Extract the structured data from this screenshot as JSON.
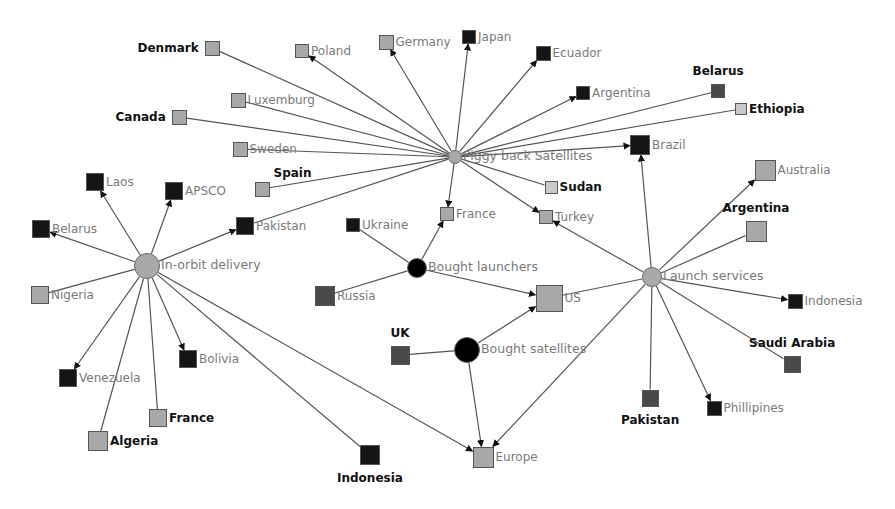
{
  "diagram": {
    "type": "network",
    "colors": {
      "light": "#a8a8a8",
      "medium": "#4a4a4a",
      "dark": "#151515",
      "pale": "#c9c9c9",
      "hub_gray": "#a9a9a9",
      "hub_black": "#000000",
      "edge": "#555555"
    },
    "hubs": [
      {
        "id": "piggy",
        "label": "Piggy back Satellites",
        "x": 455,
        "y": 157,
        "r": 7,
        "color": "hub_gray"
      },
      {
        "id": "inorbit",
        "label": "In-orbit delivery",
        "x": 147,
        "y": 266,
        "r": 13,
        "color": "hub_gray"
      },
      {
        "id": "launchers",
        "label": "Bought launchers",
        "x": 417,
        "y": 268,
        "r": 10,
        "color": "hub_black"
      },
      {
        "id": "satellites",
        "label": "Bought satellites",
        "x": 467,
        "y": 350,
        "r": 13,
        "color": "hub_black"
      },
      {
        "id": "launchsvc",
        "label": "Launch services",
        "x": 652,
        "y": 277,
        "r": 10,
        "color": "hub_gray"
      }
    ],
    "nodes": [
      {
        "id": "denmark",
        "label": "Denmark",
        "x": 212,
        "y": 48,
        "s": 15,
        "color": "light",
        "lpos": "left",
        "bold": true
      },
      {
        "id": "poland",
        "label": "Poland",
        "x": 302,
        "y": 51,
        "s": 14,
        "color": "light",
        "lpos": "right",
        "bold": false
      },
      {
        "id": "germany",
        "label": "Germany",
        "x": 386,
        "y": 42,
        "s": 15,
        "color": "light",
        "lpos": "right",
        "bold": false
      },
      {
        "id": "japan",
        "label": "Japan",
        "x": 469,
        "y": 37,
        "s": 14,
        "color": "dark",
        "lpos": "right",
        "bold": false
      },
      {
        "id": "ecuador",
        "label": "Ecuador",
        "x": 543,
        "y": 53,
        "s": 15,
        "color": "dark",
        "lpos": "right",
        "bold": false
      },
      {
        "id": "argentina1",
        "label": "Argentina",
        "x": 583,
        "y": 93,
        "s": 14,
        "color": "dark",
        "lpos": "right",
        "bold": false
      },
      {
        "id": "belarus1",
        "label": "Belarus",
        "x": 718,
        "y": 91,
        "s": 14,
        "color": "medium",
        "lpos": "top",
        "bold": true
      },
      {
        "id": "ethiopia",
        "label": "Ethiopia",
        "x": 741,
        "y": 109,
        "s": 12,
        "color": "pale",
        "lpos": "right",
        "bold": true
      },
      {
        "id": "luxemburg",
        "label": "Luxemburg",
        "x": 238,
        "y": 100,
        "s": 15,
        "color": "light",
        "lpos": "right",
        "bold": false
      },
      {
        "id": "canada",
        "label": "Canada",
        "x": 179,
        "y": 117,
        "s": 15,
        "color": "light",
        "lpos": "left",
        "bold": true
      },
      {
        "id": "sweden",
        "label": "Sweden",
        "x": 240,
        "y": 149,
        "s": 15,
        "color": "light",
        "lpos": "right",
        "bold": false
      },
      {
        "id": "spain",
        "label": "Spain",
        "x": 262,
        "y": 189,
        "s": 15,
        "color": "light",
        "lpos": "topright",
        "bold": true
      },
      {
        "id": "brazil",
        "label": "Brazil",
        "x": 640,
        "y": 145,
        "s": 20,
        "color": "dark",
        "lpos": "right",
        "bold": false
      },
      {
        "id": "sudan",
        "label": "Sudan",
        "x": 551,
        "y": 187,
        "s": 13,
        "color": "pale",
        "lpos": "right",
        "bold": true
      },
      {
        "id": "france1",
        "label": "France",
        "x": 447,
        "y": 214,
        "s": 14,
        "color": "light",
        "lpos": "right",
        "bold": false
      },
      {
        "id": "turkey",
        "label": "Turkey",
        "x": 546,
        "y": 217,
        "s": 14,
        "color": "light",
        "lpos": "right",
        "bold": false
      },
      {
        "id": "laos",
        "label": "Laos",
        "x": 95,
        "y": 182,
        "s": 18,
        "color": "dark",
        "lpos": "right",
        "bold": false
      },
      {
        "id": "apsco",
        "label": "APSCO",
        "x": 174,
        "y": 191,
        "s": 18,
        "color": "dark",
        "lpos": "right",
        "bold": false
      },
      {
        "id": "belarus2",
        "label": "Belarus",
        "x": 41,
        "y": 229,
        "s": 18,
        "color": "dark",
        "lpos": "right",
        "bold": false
      },
      {
        "id": "pakistan1",
        "label": "Pakistan",
        "x": 245,
        "y": 226,
        "s": 18,
        "color": "dark",
        "lpos": "right",
        "bold": false
      },
      {
        "id": "ukraine",
        "label": "Ukraine",
        "x": 353,
        "y": 225,
        "s": 14,
        "color": "dark",
        "lpos": "right",
        "bold": false
      },
      {
        "id": "nigeria",
        "label": "Nigeria",
        "x": 40,
        "y": 295,
        "s": 18,
        "color": "light",
        "lpos": "right",
        "bold": false
      },
      {
        "id": "russia",
        "label": "Russia",
        "x": 325,
        "y": 296,
        "s": 20,
        "color": "medium",
        "lpos": "right",
        "bold": false
      },
      {
        "id": "us",
        "label": "US",
        "x": 549,
        "y": 298,
        "s": 27,
        "color": "light",
        "lpos": "right",
        "bold": false
      },
      {
        "id": "uk",
        "label": "UK",
        "x": 400,
        "y": 355,
        "s": 19,
        "color": "medium",
        "lpos": "top",
        "bold": true
      },
      {
        "id": "australia",
        "label": "Australia",
        "x": 765,
        "y": 170,
        "s": 21,
        "color": "light",
        "lpos": "right",
        "bold": false
      },
      {
        "id": "argentina2",
        "label": "Argentina",
        "x": 756,
        "y": 231,
        "s": 21,
        "color": "light",
        "lpos": "top",
        "bold": true
      },
      {
        "id": "indonesia1",
        "label": "Indonesia",
        "x": 795,
        "y": 301,
        "s": 15,
        "color": "dark",
        "lpos": "right",
        "bold": false
      },
      {
        "id": "saudi",
        "label": "Saudi Arabia",
        "x": 792,
        "y": 364,
        "s": 17,
        "color": "medium",
        "lpos": "top",
        "bold": true
      },
      {
        "id": "bolivia",
        "label": "Bolivia",
        "x": 188,
        "y": 359,
        "s": 18,
        "color": "dark",
        "lpos": "right",
        "bold": false
      },
      {
        "id": "venezuela",
        "label": "Venezuela",
        "x": 68,
        "y": 378,
        "s": 18,
        "color": "dark",
        "lpos": "right",
        "bold": false
      },
      {
        "id": "france2",
        "label": "France",
        "x": 158,
        "y": 418,
        "s": 18,
        "color": "light",
        "lpos": "right",
        "bold": true
      },
      {
        "id": "algeria",
        "label": "Algeria",
        "x": 98,
        "y": 441,
        "s": 20,
        "color": "light",
        "lpos": "right",
        "bold": true
      },
      {
        "id": "indonesia2",
        "label": "Indonesia",
        "x": 370,
        "y": 455,
        "s": 20,
        "color": "dark",
        "lpos": "bottom",
        "bold": true
      },
      {
        "id": "europe",
        "label": "Europe",
        "x": 483,
        "y": 457,
        "s": 21,
        "color": "light",
        "lpos": "right",
        "bold": false
      },
      {
        "id": "pakistan2",
        "label": "Pakistan",
        "x": 650,
        "y": 398,
        "s": 17,
        "color": "medium",
        "lpos": "bottom",
        "bold": true
      },
      {
        "id": "phillipines",
        "label": "Phillipines",
        "x": 714,
        "y": 408,
        "s": 15,
        "color": "dark",
        "lpos": "right",
        "bold": false
      }
    ],
    "edges": [
      {
        "from": "piggy",
        "to": "denmark",
        "arrow": false
      },
      {
        "from": "piggy",
        "to": "poland",
        "arrow": true
      },
      {
        "from": "piggy",
        "to": "germany",
        "arrow": true
      },
      {
        "from": "piggy",
        "to": "japan",
        "arrow": true
      },
      {
        "from": "piggy",
        "to": "ecuador",
        "arrow": true
      },
      {
        "from": "piggy",
        "to": "argentina1",
        "arrow": true
      },
      {
        "from": "piggy",
        "to": "belarus1",
        "arrow": false
      },
      {
        "from": "piggy",
        "to": "ethiopia",
        "arrow": false
      },
      {
        "from": "piggy",
        "to": "luxemburg",
        "arrow": false
      },
      {
        "from": "piggy",
        "to": "canada",
        "arrow": false
      },
      {
        "from": "piggy",
        "to": "sweden",
        "arrow": false
      },
      {
        "from": "piggy",
        "to": "spain",
        "arrow": false
      },
      {
        "from": "piggy",
        "to": "pakistan1",
        "arrow": false
      },
      {
        "from": "piggy",
        "to": "brazil",
        "arrow": true
      },
      {
        "from": "piggy",
        "to": "sudan",
        "arrow": false
      },
      {
        "from": "piggy",
        "to": "france1",
        "arrow": true
      },
      {
        "from": "piggy",
        "to": "turkey",
        "arrow": true
      },
      {
        "from": "inorbit",
        "to": "laos",
        "arrow": true
      },
      {
        "from": "inorbit",
        "to": "apsco",
        "arrow": true
      },
      {
        "from": "inorbit",
        "to": "belarus2",
        "arrow": true
      },
      {
        "from": "inorbit",
        "to": "pakistan1",
        "arrow": true
      },
      {
        "from": "inorbit",
        "to": "nigeria",
        "arrow": false
      },
      {
        "from": "inorbit",
        "to": "venezuela",
        "arrow": true
      },
      {
        "from": "inorbit",
        "to": "algeria",
        "arrow": false
      },
      {
        "from": "inorbit",
        "to": "france2",
        "arrow": false
      },
      {
        "from": "inorbit",
        "to": "bolivia",
        "arrow": true
      },
      {
        "from": "inorbit",
        "to": "indonesia2",
        "arrow": false
      },
      {
        "from": "inorbit",
        "to": "europe",
        "arrow": true
      },
      {
        "from": "launchers",
        "to": "ukraine",
        "arrow": false
      },
      {
        "from": "launchers",
        "to": "russia",
        "arrow": false
      },
      {
        "from": "launchers",
        "to": "france1",
        "arrow": true
      },
      {
        "from": "launchers",
        "to": "us",
        "arrow": true
      },
      {
        "from": "satellites",
        "to": "uk",
        "arrow": false
      },
      {
        "from": "satellites",
        "to": "us",
        "arrow": true
      },
      {
        "from": "satellites",
        "to": "europe",
        "arrow": true
      },
      {
        "from": "launchsvc",
        "to": "us",
        "arrow": false
      },
      {
        "from": "launchsvc",
        "to": "turkey",
        "arrow": true
      },
      {
        "from": "launchsvc",
        "to": "brazil",
        "arrow": true
      },
      {
        "from": "launchsvc",
        "to": "australia",
        "arrow": true
      },
      {
        "from": "launchsvc",
        "to": "argentina2",
        "arrow": false
      },
      {
        "from": "launchsvc",
        "to": "indonesia1",
        "arrow": true
      },
      {
        "from": "launchsvc",
        "to": "saudi",
        "arrow": false
      },
      {
        "from": "launchsvc",
        "to": "pakistan2",
        "arrow": false
      },
      {
        "from": "launchsvc",
        "to": "phillipines",
        "arrow": true
      },
      {
        "from": "launchsvc",
        "to": "europe",
        "arrow": true
      }
    ]
  }
}
